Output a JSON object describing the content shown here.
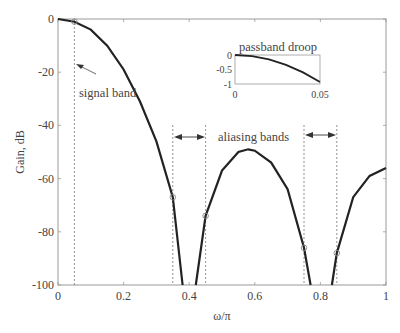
{
  "chart_data": {
    "type": "line",
    "title": "",
    "xlabel": "ω/π",
    "ylabel": "Gain, dB",
    "xlim": [
      0,
      1
    ],
    "ylim": [
      -100,
      0
    ],
    "xticks": [
      "0",
      "0.2",
      "0.4",
      "0.6",
      "0.8",
      "1"
    ],
    "yticks": [
      "0",
      "-20",
      "-40",
      "-60",
      "-80",
      "-100"
    ],
    "grid": false,
    "series": [
      {
        "name": "filter gain",
        "x": [
          0,
          0.05,
          0.1,
          0.15,
          0.2,
          0.25,
          0.3,
          0.35,
          0.38,
          0.42,
          0.45,
          0.5,
          0.55,
          0.58,
          0.6,
          0.65,
          0.7,
          0.75,
          0.77,
          0.835,
          0.85,
          0.9,
          0.95,
          1.0
        ],
        "y": [
          0,
          -1,
          -4,
          -10,
          -19,
          -31,
          -46,
          -67,
          -100,
          -100,
          -74,
          -57,
          -50,
          -49,
          -49.5,
          -54,
          -64,
          -86,
          -100,
          -100,
          -88,
          -67,
          -59,
          -56
        ]
      }
    ],
    "markers": [
      {
        "x": 0.05,
        "y": -1
      },
      {
        "x": 0.35,
        "y": -67
      },
      {
        "x": 0.45,
        "y": -74
      },
      {
        "x": 0.75,
        "y": -86
      },
      {
        "x": 0.85,
        "y": -88
      }
    ],
    "vlines": [
      0.05,
      0.35,
      0.45,
      0.75,
      0.85
    ],
    "annotations": [
      {
        "text": "signal band",
        "x": 0.05,
        "y": -17
      },
      {
        "text": "aliasing bands",
        "x": 0.6,
        "y": -41
      },
      {
        "text": "passband droop",
        "type": "inset-title"
      }
    ],
    "inset": {
      "title": "passband droop",
      "xlim": [
        0,
        0.05
      ],
      "ylim": [
        -1,
        0
      ],
      "xticks": [
        "0",
        "0.05"
      ],
      "yticks": [
        "0",
        "-0.5",
        "-1"
      ],
      "x": [
        0,
        0.01,
        0.02,
        0.03,
        0.04,
        0.05
      ],
      "y": [
        0,
        -0.04,
        -0.15,
        -0.34,
        -0.6,
        -0.93
      ]
    }
  }
}
